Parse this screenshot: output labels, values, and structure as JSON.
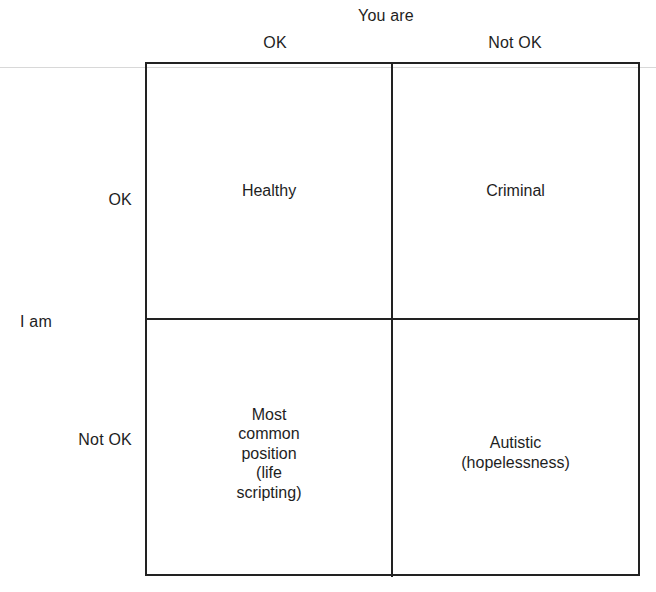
{
  "axes": {
    "top_title": "You are",
    "left_title": "I am",
    "columns": [
      {
        "label": "OK"
      },
      {
        "label": "Not OK"
      }
    ],
    "rows": [
      {
        "label": "OK"
      },
      {
        "label": "Not OK"
      }
    ]
  },
  "cells": [
    {
      "row": "OK",
      "col": "OK",
      "text": "Healthy"
    },
    {
      "row": "OK",
      "col": "Not OK",
      "text": "Criminal"
    },
    {
      "row": "Not OK",
      "col": "OK",
      "text": "Most\ncommon\nposition\n(life\nscripting)"
    },
    {
      "row": "Not OK",
      "col": "Not OK",
      "text": "Autistic\n(hopelessness)"
    }
  ],
  "colors": {
    "line": "#222222",
    "text": "#1e1e1e",
    "background": "#ffffff"
  }
}
